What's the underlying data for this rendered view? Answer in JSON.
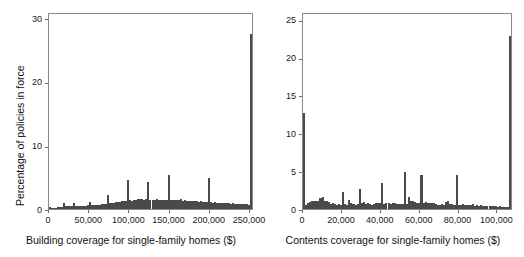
{
  "figure": {
    "type": "two-panel-histogram-figure",
    "background": "#ffffff",
    "bar_color": "#4a4a4a",
    "axis_color": "#8a8a8a"
  },
  "chart_data": [
    {
      "type": "bar",
      "panel": "left",
      "title": "",
      "xlabel": "Building coverage for single-family homes ($)",
      "ylabel": "Percentage of policies in force",
      "xlim": [
        0,
        255000
      ],
      "ylim": [
        0,
        31
      ],
      "xticks": [
        0,
        50000,
        100000,
        150000,
        200000,
        250000
      ],
      "xtick_labels": [
        "0",
        "50,000",
        "100,000",
        "150,000",
        "200,000",
        "250,000"
      ],
      "yticks": [
        0,
        10,
        20,
        30
      ],
      "ytick_labels": [
        "0",
        "10",
        "20",
        "30"
      ],
      "grid": false,
      "legend": "none",
      "bin_width": 2500,
      "bin_starts": [
        0,
        2500,
        5000,
        7500,
        10000,
        12500,
        15000,
        17500,
        20000,
        22500,
        25000,
        27500,
        30000,
        32500,
        35000,
        37500,
        40000,
        42500,
        45000,
        47500,
        50000,
        52500,
        55000,
        57500,
        60000,
        62500,
        65000,
        67500,
        70000,
        72500,
        75000,
        77500,
        80000,
        82500,
        85000,
        87500,
        90000,
        92500,
        95000,
        97500,
        100000,
        102500,
        105000,
        107500,
        110000,
        112500,
        115000,
        117500,
        120000,
        122500,
        125000,
        127500,
        130000,
        132500,
        135000,
        137500,
        140000,
        142500,
        145000,
        147500,
        150000,
        152500,
        155000,
        157500,
        160000,
        162500,
        165000,
        167500,
        170000,
        172500,
        175000,
        177500,
        180000,
        182500,
        185000,
        187500,
        190000,
        192500,
        195000,
        197500,
        200000,
        202500,
        205000,
        207500,
        210000,
        212500,
        215000,
        217500,
        220000,
        222500,
        225000,
        227500,
        230000,
        232500,
        235000,
        237500,
        240000,
        242500,
        245000,
        247500,
        250000
      ],
      "values": [
        0.3,
        0.15,
        0.18,
        0.22,
        0.25,
        0.3,
        0.35,
        0.9,
        0.45,
        0.4,
        0.45,
        0.5,
        0.9,
        0.45,
        0.4,
        0.45,
        0.5,
        0.55,
        0.55,
        0.6,
        1.05,
        0.65,
        0.6,
        0.65,
        0.7,
        0.7,
        0.75,
        0.8,
        0.85,
        2.2,
        0.95,
        0.9,
        1.0,
        1.05,
        1.1,
        1.15,
        1.2,
        1.2,
        1.25,
        4.5,
        1.35,
        1.3,
        1.4,
        1.45,
        1.55,
        1.65,
        1.55,
        1.45,
        1.5,
        4.2,
        1.45,
        1.4,
        1.45,
        1.5,
        1.4,
        1.45,
        1.4,
        1.45,
        1.4,
        5.3,
        1.35,
        1.4,
        1.35,
        1.4,
        1.35,
        1.55,
        1.3,
        1.35,
        1.3,
        1.25,
        1.3,
        1.2,
        1.25,
        1.2,
        1.15,
        1.2,
        1.1,
        1.15,
        1.1,
        4.95,
        1.05,
        1.0,
        1.05,
        1.0,
        0.95,
        1.0,
        0.95,
        0.9,
        0.95,
        0.9,
        0.85,
        0.9,
        0.85,
        0.8,
        0.85,
        0.8,
        0.75,
        0.8,
        0.75,
        0.7,
        27.5
      ]
    },
    {
      "type": "bar",
      "panel": "right",
      "title": "",
      "xlabel": "Contents coverage for single-family homes ($)",
      "ylabel": "",
      "xlim": [
        0,
        108000
      ],
      "ylim": [
        0,
        26
      ],
      "xticks": [
        0,
        20000,
        40000,
        60000,
        80000,
        100000
      ],
      "xtick_labels": [
        "0",
        "20,000",
        "40,000",
        "60,000",
        "80,000",
        "100,000"
      ],
      "yticks": [
        0,
        5,
        10,
        15,
        20,
        25
      ],
      "ytick_labels": [
        "0",
        "5",
        "10",
        "15",
        "20",
        "25"
      ],
      "grid": false,
      "legend": "none",
      "bin_width": 1060,
      "bin_starts": [
        0,
        1060,
        2120,
        3180,
        4240,
        5300,
        6360,
        7420,
        8480,
        9540,
        10600,
        11660,
        12720,
        13780,
        14840,
        15900,
        16960,
        18020,
        19080,
        20140,
        21200,
        22260,
        23320,
        24380,
        25440,
        26500,
        27560,
        28620,
        29680,
        30740,
        31800,
        32860,
        33920,
        34980,
        36040,
        37100,
        38160,
        39220,
        40280,
        41340,
        42400,
        43460,
        44520,
        45580,
        46640,
        47700,
        48760,
        49820,
        50880,
        51940,
        53000,
        54060,
        55120,
        56180,
        57240,
        58300,
        59360,
        60420,
        61480,
        62540,
        63600,
        64660,
        65720,
        66780,
        67840,
        68900,
        69960,
        71020,
        72080,
        73140,
        74200,
        75260,
        76320,
        77380,
        78440,
        79500,
        80560,
        81620,
        82680,
        83740,
        84800,
        85860,
        86920,
        87980,
        89040,
        90100,
        91160,
        92220,
        93280,
        94340,
        95400,
        96460,
        97520,
        98580,
        99640,
        100700,
        101760,
        102820,
        103880,
        104940,
        106000
      ],
      "values": [
        12.7,
        0.55,
        0.85,
        0.95,
        1.0,
        1.1,
        1.0,
        1.05,
        1.5,
        1.65,
        1.1,
        1.1,
        0.95,
        0.7,
        0.75,
        0.6,
        0.55,
        0.6,
        0.55,
        2.25,
        0.6,
        0.55,
        1.15,
        0.8,
        0.6,
        0.55,
        0.6,
        2.6,
        0.85,
        0.9,
        0.6,
        0.8,
        0.6,
        0.55,
        0.6,
        0.85,
        0.8,
        0.75,
        3.45,
        0.7,
        0.85,
        0.8,
        0.7,
        0.75,
        0.8,
        0.65,
        0.7,
        0.65,
        0.6,
        4.9,
        0.7,
        1.55,
        1.0,
        1.0,
        0.95,
        0.85,
        0.8,
        4.55,
        0.75,
        0.95,
        0.85,
        0.8,
        0.85,
        0.8,
        0.7,
        0.55,
        0.5,
        0.6,
        0.55,
        0.9,
        1.05,
        0.7,
        0.6,
        0.55,
        4.5,
        0.5,
        0.55,
        0.6,
        0.55,
        0.5,
        0.55,
        0.5,
        0.6,
        0.45,
        0.5,
        0.45,
        0.5,
        0.45,
        0.4,
        0.45,
        0.4,
        0.35,
        0.4,
        0.35,
        0.3,
        0.35,
        0.3,
        0.25,
        0.3,
        0.25,
        22.8
      ]
    }
  ]
}
